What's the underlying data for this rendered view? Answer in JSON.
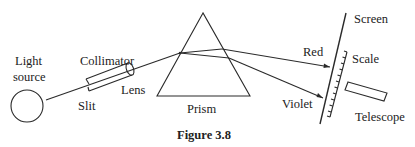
{
  "figure": {
    "caption": "Figure 3.8",
    "labels": {
      "light_source_line1": "Light",
      "light_source_line2": "source",
      "collimator": "Collimator",
      "slit": "Slit",
      "lens": "Lens",
      "prism": "Prism",
      "red": "Red",
      "violet": "Violet",
      "screen": "Screen",
      "scale": "Scale",
      "telescope": "Telescope"
    },
    "components": [
      "light-source",
      "collimator",
      "slit",
      "lens",
      "prism",
      "screen",
      "scale",
      "telescope"
    ],
    "rays": [
      {
        "name": "incident-ray",
        "color_label": ""
      },
      {
        "name": "red-ray",
        "color_label": "Red"
      },
      {
        "name": "violet-ray",
        "color_label": "Violet"
      }
    ]
  }
}
